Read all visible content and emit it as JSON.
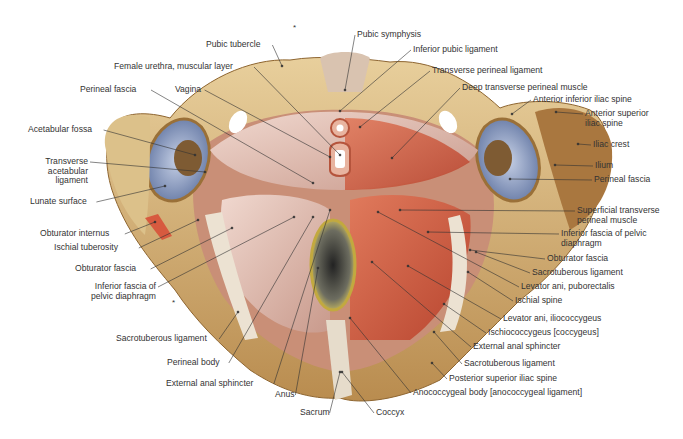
{
  "figure": {
    "colors": {
      "bone": "#d9b77a",
      "bone_dark": "#a77c42",
      "muscle": "#cf5a3f",
      "muscle_light": "#e9a089",
      "fascia": "#e8c7bd",
      "cartilage": "#7f90b5",
      "leader": "#333333"
    },
    "asterisks": [
      {
        "x": 293,
        "y": 30
      },
      {
        "x": 172,
        "y": 305
      }
    ],
    "labels": [
      {
        "id": "pubic-tubercle",
        "text": "Pubic tubercle",
        "x": 206,
        "y": 40,
        "align": "l",
        "tx": 282,
        "ty": 66
      },
      {
        "id": "female-urethra",
        "text": "Female urethra, muscular layer",
        "x": 114,
        "y": 62,
        "align": "l",
        "tx": 340,
        "ty": 155
      },
      {
        "id": "perineal-fascia-left",
        "text": "Perineal fascia",
        "x": 80,
        "y": 85,
        "align": "l",
        "tx": 313,
        "ty": 183
      },
      {
        "id": "vagina",
        "text": "Vagina",
        "x": 175,
        "y": 85,
        "align": "l",
        "tx": 330,
        "ty": 157
      },
      {
        "id": "acetabular-fossa",
        "text": "Acetabular fossa",
        "x": 28,
        "y": 125,
        "align": "l",
        "tx": 195,
        "ty": 155
      },
      {
        "id": "transverse-acetabular-ligament",
        "text": "Transverse\nacetabular\nligament",
        "x": 42,
        "y": 157,
        "align": "r",
        "w": 46,
        "tx": 205,
        "ty": 172
      },
      {
        "id": "lunate-surface",
        "text": "Lunate surface",
        "x": 30,
        "y": 197,
        "align": "l",
        "tx": 165,
        "ty": 186
      },
      {
        "id": "obturator-internus",
        "text": "Obturator internus",
        "x": 40,
        "y": 229,
        "align": "l",
        "tx": 155,
        "ty": 222
      },
      {
        "id": "ischial-tuberosity",
        "text": "Ischial tuberosity",
        "x": 54,
        "y": 243,
        "align": "l",
        "tx": 198,
        "ty": 220
      },
      {
        "id": "obturator-fascia-left",
        "text": "Obturator fascia",
        "x": 75,
        "y": 264,
        "align": "l",
        "tx": 232,
        "ty": 228
      },
      {
        "id": "inferior-fascia-pelvic-diaphragm-left",
        "text": "Inferior fascia of\npelvic diaphragm",
        "x": 88,
        "y": 282,
        "align": "r",
        "w": 68,
        "tx": 294,
        "ty": 217
      },
      {
        "id": "sacrotuberous-ligament-left",
        "text": "Sacrotuberous ligament",
        "x": 116,
        "y": 334,
        "align": "l",
        "tx": 238,
        "ty": 312
      },
      {
        "id": "perineal-body",
        "text": "Perineal body",
        "x": 167,
        "y": 358,
        "align": "l",
        "tx": 313,
        "ty": 217
      },
      {
        "id": "external-anal-sphincter-left",
        "text": "External anal sphincter",
        "x": 166,
        "y": 379,
        "align": "l",
        "tx": 330,
        "ty": 210
      },
      {
        "id": "anus",
        "text": "Anus",
        "x": 275,
        "y": 390,
        "align": "l",
        "tx": 318,
        "ty": 268
      },
      {
        "id": "sacrum",
        "text": "Sacrum",
        "x": 300,
        "y": 408,
        "align": "l",
        "tx": 340,
        "ty": 372
      },
      {
        "id": "coccyx",
        "text": "Coccyx",
        "x": 376,
        "y": 408,
        "align": "l",
        "tx": 342,
        "ty": 372
      },
      {
        "id": "pubic-symphysis",
        "text": "Pubic symphysis",
        "x": 357,
        "y": 30,
        "align": "l",
        "tx": 345,
        "ty": 90
      },
      {
        "id": "inferior-pubic-ligament",
        "text": "Inferior pubic ligament",
        "x": 413,
        "y": 45,
        "align": "l",
        "tx": 340,
        "ty": 111
      },
      {
        "id": "transverse-perineal-ligament",
        "text": "Transverse perineal ligament",
        "x": 432,
        "y": 66,
        "align": "l",
        "tx": 360,
        "ty": 127
      },
      {
        "id": "deep-transverse-perineal-muscle",
        "text": "Deep transverse perineal muscle",
        "x": 462,
        "y": 83,
        "align": "l",
        "tx": 392,
        "ty": 158
      },
      {
        "id": "anterior-inferior-iliac-spine",
        "text": "Anterior inferior iliac spine",
        "x": 533,
        "y": 95,
        "align": "l",
        "tx": 512,
        "ty": 114
      },
      {
        "id": "anterior-superior-iliac-spine",
        "text": "Anterior superior\niliac spine",
        "x": 585,
        "y": 109,
        "align": "l",
        "tx": 556,
        "ty": 112
      },
      {
        "id": "iliac-crest",
        "text": "Iliac crest",
        "x": 593,
        "y": 140,
        "align": "l",
        "tx": 578,
        "ty": 144
      },
      {
        "id": "ilium",
        "text": "Ilium",
        "x": 595,
        "y": 161,
        "align": "l",
        "tx": 555,
        "ty": 165
      },
      {
        "id": "perineal-fascia-right",
        "text": "Perineal fascia",
        "x:": 0,
        "x": 594,
        "y": 175,
        "align": "l",
        "tx": 510,
        "ty": 179
      },
      {
        "id": "superficial-transverse-perineal-muscle",
        "text": "Superficial transverse\nperineal muscle",
        "x": 577,
        "y": 206,
        "align": "l",
        "tx": 400,
        "ty": 210
      },
      {
        "id": "inferior-fascia-pelvic-diaphragm-right",
        "text": "Inferior fascia of pelvic\ndiaphragm",
        "x": 561,
        "y": 229,
        "align": "l",
        "tx": 428,
        "ty": 232
      },
      {
        "id": "obturator-fascia-right",
        "text": "Obturator fascia",
        "x": 547,
        "y": 254,
        "align": "l",
        "tx": 470,
        "ty": 250
      },
      {
        "id": "sacrotuberous-ligament-right-upper",
        "text": "Sacrotuberous ligament",
        "x": 532,
        "y": 268,
        "align": "l",
        "tx": 476,
        "ty": 252
      },
      {
        "id": "levator-ani-puborectalis",
        "text": "Levator ani, puborectalis",
        "x": 521,
        "y": 282,
        "align": "l",
        "tx": 378,
        "ty": 212
      },
      {
        "id": "ischial-spine",
        "text": "Ischial spine",
        "x": 515,
        "y": 296,
        "align": "l",
        "tx": 468,
        "ty": 272
      },
      {
        "id": "levator-ani-iliococcygeus",
        "text": "Levator ani, iliococcygeus",
        "x": 503,
        "y": 314,
        "align": "l",
        "tx": 408,
        "ty": 266
      },
      {
        "id": "ischiococcygeus",
        "text": "Ischiococcygeus [coccygeus]",
        "x": 488,
        "y": 328,
        "align": "l",
        "tx": 444,
        "ty": 304
      },
      {
        "id": "external-anal-sphincter-right",
        "text": "External anal sphincter",
        "x": 473,
        "y": 342,
        "align": "l",
        "tx": 372,
        "ty": 262
      },
      {
        "id": "sacrotuberous-ligament-right-lower",
        "text": "Sacrotuberous ligament",
        "x": 464,
        "y": 359,
        "align": "l",
        "tx": 434,
        "ty": 332
      },
      {
        "id": "posterior-superior-iliac-spine",
        "text": "Posterior superior iliac spine",
        "x": 449,
        "y": 374,
        "align": "l",
        "tx": 432,
        "ty": 363
      },
      {
        "id": "anococcygeal-body",
        "text": "Anococcygeal body [anococcygeal ligament]",
        "x": 413,
        "y": 388,
        "align": "l",
        "tx": 350,
        "ty": 318
      }
    ]
  }
}
